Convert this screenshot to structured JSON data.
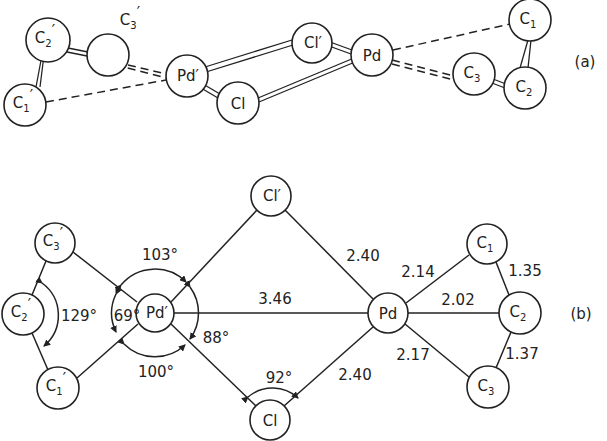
{
  "panel_a": {
    "label": "(a)",
    "atoms": [
      {
        "id": "C2p",
        "symbol": "C",
        "sub": "2",
        "prime": "′",
        "x": 48,
        "y": 40,
        "r": 22
      },
      {
        "id": "C3p",
        "symbol": "",
        "sub": "",
        "prime": "",
        "x": 108,
        "y": 55,
        "r": 21
      },
      {
        "id": "C1p",
        "symbol": "C",
        "sub": "1",
        "prime": "′",
        "x": 25,
        "y": 105,
        "r": 21
      },
      {
        "id": "Pdp",
        "symbol": "Pd",
        "sub": "",
        "prime": "′",
        "x": 187,
        "y": 76,
        "r": 21
      },
      {
        "id": "Cl",
        "symbol": "Cl",
        "sub": "",
        "prime": "",
        "x": 238,
        "y": 103,
        "r": 21
      },
      {
        "id": "Clp",
        "symbol": "Cl",
        "sub": "",
        "prime": "′",
        "x": 312,
        "y": 43,
        "r": 20
      },
      {
        "id": "Pd",
        "symbol": "Pd",
        "sub": "",
        "prime": "",
        "x": 372,
        "y": 55,
        "r": 21
      },
      {
        "id": "C1",
        "symbol": "C",
        "sub": "1",
        "prime": "",
        "x": 530,
        "y": 20,
        "r": 21
      },
      {
        "id": "C3",
        "symbol": "C",
        "sub": "3",
        "prime": "",
        "x": 474,
        "y": 74,
        "r": 21
      },
      {
        "id": "C2",
        "symbol": "C",
        "sub": "2",
        "prime": "",
        "x": 525,
        "y": 88,
        "r": 21
      }
    ],
    "floating_label": {
      "symbol": "C",
      "sub": "3",
      "prime": "′",
      "x": 130,
      "y": 22
    }
  },
  "panel_b": {
    "label": "(b)",
    "atoms": [
      {
        "id": "C3p",
        "symbol": "C",
        "sub": "3",
        "prime": "′",
        "x": 55,
        "y": 243,
        "r": 20
      },
      {
        "id": "C2p",
        "symbol": "C",
        "sub": "2",
        "prime": "′",
        "x": 23,
        "y": 314,
        "r": 21
      },
      {
        "id": "C1p",
        "symbol": "C",
        "sub": "1",
        "prime": "′",
        "x": 58,
        "y": 388,
        "r": 21
      },
      {
        "id": "Pdp",
        "symbol": "Pd",
        "sub": "",
        "prime": "′",
        "x": 155,
        "y": 313,
        "r": 19
      },
      {
        "id": "Clp",
        "symbol": "Cl",
        "sub": "",
        "prime": "′",
        "x": 271,
        "y": 196,
        "r": 20
      },
      {
        "id": "Cl",
        "symbol": "Cl",
        "sub": "",
        "prime": "",
        "x": 270,
        "y": 420,
        "r": 20
      },
      {
        "id": "Pd",
        "symbol": "Pd",
        "sub": "",
        "prime": "",
        "x": 388,
        "y": 313,
        "r": 20
      },
      {
        "id": "C1",
        "symbol": "C",
        "sub": "1",
        "prime": "",
        "x": 487,
        "y": 244,
        "r": 20
      },
      {
        "id": "C2",
        "symbol": "C",
        "sub": "2",
        "prime": "",
        "x": 520,
        "y": 313,
        "r": 21
      },
      {
        "id": "C3",
        "symbol": "C",
        "sub": "3",
        "prime": "",
        "x": 488,
        "y": 387,
        "r": 21
      }
    ],
    "bond_lengths": {
      "pd_clp": "2.40",
      "pd_cl": "2.40",
      "pd_pdp": "3.46",
      "pd_c1": "2.14",
      "pd_c2": "2.02",
      "pd_c3": "2.17",
      "c1_c2": "1.35",
      "c2_c3": "1.37"
    },
    "angles": {
      "c3p_pdp_clp": "103°",
      "c1p_pdp_cl": "100°",
      "c1p_pdp_c3p": "69°",
      "clp_pdp_cl": "88°",
      "pdp_cl_pd": "92°",
      "c1p_c2p_c3p": "129°"
    }
  }
}
